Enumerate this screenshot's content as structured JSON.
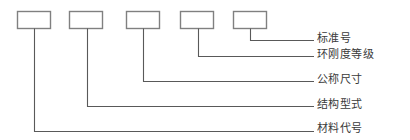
{
  "diagram": {
    "type": "designation-breakdown",
    "orientation": "horizontal-boxes-with-leader-lines",
    "colors": {
      "box_stroke": "#808080",
      "box_fill": "#ffffff",
      "leader_line": "#595959",
      "text": "#3a3a3a",
      "background": "#ffffff"
    },
    "boxes": [
      {
        "index": 1,
        "label": "",
        "x": 17,
        "y": 11,
        "width": 34,
        "height": 18,
        "drop_x": 34,
        "drop_y": 131
      },
      {
        "index": 2,
        "label": "",
        "x": 69,
        "y": 11,
        "width": 34,
        "height": 18,
        "drop_x": 87,
        "drop_y": 106
      },
      {
        "index": 3,
        "label": "",
        "x": 126,
        "y": 11,
        "width": 34,
        "height": 18,
        "drop_x": 143,
        "drop_y": 81
      },
      {
        "index": 4,
        "label": "",
        "x": 180,
        "y": 11,
        "width": 34,
        "height": 18,
        "drop_x": 198,
        "drop_y": 56
      },
      {
        "index": 5,
        "label": "",
        "x": 233,
        "y": 11,
        "width": 34,
        "height": 18,
        "drop_x": 250,
        "drop_y": 40
      }
    ],
    "callouts": [
      {
        "id": "standard-number",
        "text": "标准号",
        "box_index": 5,
        "line_y": 40,
        "line_x_start": 250,
        "line_x_end": 314
      },
      {
        "id": "stiffness-grade",
        "text": "环刚度等级",
        "box_index": 4,
        "line_y": 56,
        "line_x_start": 198,
        "line_x_end": 314
      },
      {
        "id": "nominal-size",
        "text": "公称尺寸",
        "box_index": 3,
        "line_y": 81,
        "line_x_start": 143,
        "line_x_end": 314
      },
      {
        "id": "structure-type",
        "text": "结构型式",
        "box_index": 2,
        "line_y": 106,
        "line_x_start": 87,
        "line_x_end": 314
      },
      {
        "id": "material-code",
        "text": "材料代号",
        "box_index": 1,
        "line_y": 131,
        "line_x_start": 34,
        "line_x_end": 314
      }
    ],
    "labels": {
      "standard_number": "标准号",
      "stiffness_grade": "环刚度等级",
      "nominal_size": "公称尺寸",
      "structure_type": "结构型式",
      "material_code": "材料代号"
    }
  }
}
